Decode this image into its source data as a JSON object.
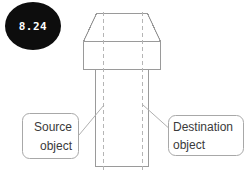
{
  "badge": {
    "label": "8.24",
    "fill_color": "#0d0d0d",
    "text_color": "#ffffff"
  },
  "callouts": [
    {
      "id": "source",
      "line1": "Source",
      "line2": "object",
      "align": "right"
    },
    {
      "id": "destination",
      "line1": "Destination",
      "line2": "object",
      "align": "left"
    }
  ],
  "drawing": {
    "name": "bolt-technical-drawing",
    "line_color": "#9a9a9a",
    "centerline_color": "#b5b5b5",
    "fill_color": "#ffffff"
  }
}
